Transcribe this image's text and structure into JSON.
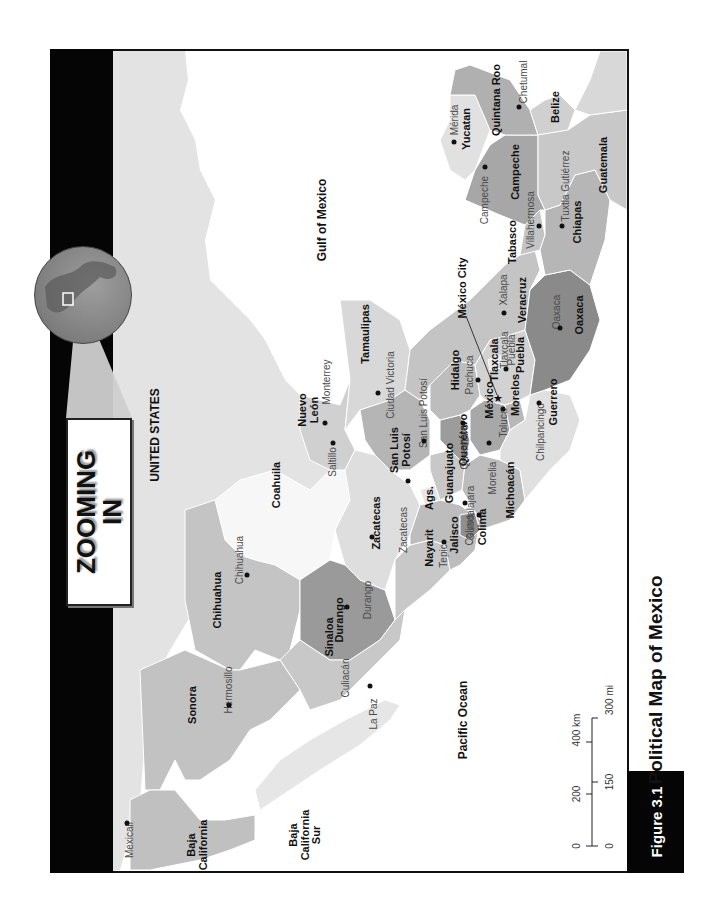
{
  "feature": {
    "title": "ZOOMING\nIN",
    "line1": "ZOOMING",
    "line2": "IN"
  },
  "figure": {
    "number": "Figure 3.1",
    "title": "Political Map of Mexico"
  },
  "water": {
    "gulf": "Gulf of Mexico",
    "pacific": "Pacific Ocean"
  },
  "countries": {
    "us": "UNITED STATES",
    "belize": "Belize",
    "guatemala": "Guatemala"
  },
  "states": [
    {
      "name": "Baja California",
      "lines": [
        "Baja",
        "California"
      ]
    },
    {
      "name": "Baja California Sur",
      "lines": [
        "Baja",
        "California",
        "Sur"
      ]
    },
    {
      "name": "Sonora"
    },
    {
      "name": "Chihuahua"
    },
    {
      "name": "Coahuila"
    },
    {
      "name": "Nuevo León",
      "lines": [
        "Nuevo",
        "León"
      ]
    },
    {
      "name": "Tamaulipas"
    },
    {
      "name": "Sinaloa"
    },
    {
      "name": "Durango"
    },
    {
      "name": "Zacatecas"
    },
    {
      "name": "San Luis Potosí",
      "lines": [
        "San Luis",
        "Potosí"
      ]
    },
    {
      "name": "Nayarit"
    },
    {
      "name": "Ags."
    },
    {
      "name": "Jalisco"
    },
    {
      "name": "Colima"
    },
    {
      "name": "Guanajuato"
    },
    {
      "name": "Querétaro"
    },
    {
      "name": "Hidalgo"
    },
    {
      "name": "México"
    },
    {
      "name": "Michoacán"
    },
    {
      "name": "Morelos"
    },
    {
      "name": "Tlaxcala"
    },
    {
      "name": "Puebla"
    },
    {
      "name": "Veracruz"
    },
    {
      "name": "Guerrero"
    },
    {
      "name": "Oaxaca"
    },
    {
      "name": "Tabasco"
    },
    {
      "name": "Chiapas"
    },
    {
      "name": "Campeche"
    },
    {
      "name": "Yucatan"
    },
    {
      "name": "Quintana Roo"
    }
  ],
  "capital": {
    "label": "México City"
  },
  "cities": {
    "mexicali": "Mexicali",
    "hermosillo": "Hermosillo",
    "la_paz": "La Paz",
    "chihuahua": "Chihuahua",
    "culiacan": "Culiacán",
    "durango": "Durango",
    "saltillo": "Saltillo",
    "monterrey": "Monterrey",
    "ciudad_victoria": "Ciudad Victoria",
    "zacatecas": "Zacatecas",
    "san_luis_potosi": "San Luis Potosí",
    "tepic": "Tepic",
    "guadalajara": "Guadalajara",
    "colima": "Colima",
    "morelia": "Morelia",
    "queretaro": "Querétaro",
    "pachuca": "Pachuca",
    "toluca": "Toluca",
    "tlaxcala": "Tlaxcala",
    "puebla": "Puebla",
    "xalapa": "Xalapa",
    "chilpancingo": "Chilpancingo",
    "oaxaca": "Oaxaca",
    "villahermosa": "Villahermosa",
    "tuxtla": "Tuxtla Gutiérrez",
    "campeche": "Campeche",
    "merida": "Mérida",
    "chetumal": "Chetumal"
  },
  "scale": {
    "km": [
      "0",
      "200",
      "400 km"
    ],
    "mi": [
      "0",
      "150",
      "300 mi"
    ]
  },
  "colors": {
    "frame": "#111111",
    "bar": "#050505",
    "land_light": "#e2e2e2",
    "land_mid": "#bdbdbd",
    "land_dark": "#9a9a9a",
    "water": "#ffffff"
  }
}
